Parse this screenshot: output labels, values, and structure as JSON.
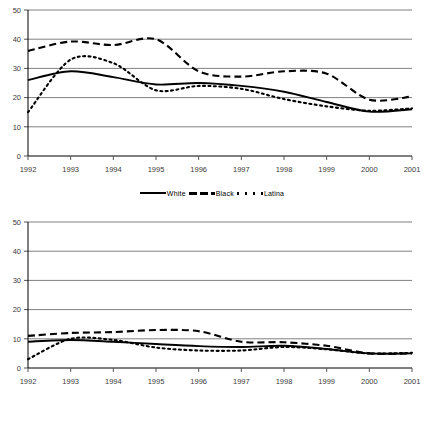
{
  "legend": {
    "items": [
      {
        "label": "White",
        "style": "solid"
      },
      {
        "label": "Black",
        "style": "dashed"
      },
      {
        "label": "Latina",
        "style": "dotted"
      }
    ]
  },
  "chart_data": [
    {
      "id": "top",
      "type": "line",
      "title": "",
      "xlabel": "",
      "ylabel": "",
      "grid": true,
      "legend_position": "bottom",
      "x": [
        "1992",
        "1993",
        "1994",
        "1995",
        "1996",
        "1997",
        "1998",
        "1999",
        "2000",
        "2001"
      ],
      "xtick_labels": [
        "1992",
        "1993",
        "1994",
        "1995",
        "1996",
        "1997",
        "1998",
        "1999",
        "2000",
        "2001"
      ],
      "ytick_labels": [
        "0",
        "10",
        "20",
        "30",
        "40",
        "50"
      ],
      "yticks": [
        0,
        10,
        20,
        30,
        40,
        50
      ],
      "ylim": [
        0,
        50
      ],
      "series": [
        {
          "name": "White",
          "values": [
            26,
            29,
            27,
            24.5,
            25,
            24,
            22,
            18.5,
            15.2,
            16
          ]
        },
        {
          "name": "Black",
          "values": [
            36,
            39.2,
            38,
            40,
            29,
            27.2,
            29,
            28.2,
            19.3,
            20.4
          ]
        },
        {
          "name": "Latina",
          "values": [
            15,
            33,
            31.8,
            22.5,
            24,
            23,
            19.5,
            17,
            15.5,
            16.3
          ]
        }
      ]
    },
    {
      "id": "bottom",
      "type": "line",
      "title": "",
      "xlabel": "",
      "ylabel": "",
      "grid": true,
      "legend_position": "bottom",
      "x": [
        "1992",
        "1993",
        "1994",
        "1995",
        "1996",
        "1997",
        "1998",
        "1999",
        "2000",
        "2001"
      ],
      "xtick_labels": [
        "1992",
        "1993",
        "1994",
        "1995",
        "1996",
        "1997",
        "1998",
        "1999",
        "2000",
        "2001"
      ],
      "ytick_labels": [
        "0",
        "10",
        "20",
        "30",
        "40",
        "50"
      ],
      "yticks": [
        0,
        10,
        20,
        30,
        40,
        50
      ],
      "ylim": [
        0,
        50
      ],
      "series": [
        {
          "name": "White",
          "values": [
            9,
            9.6,
            9,
            8.2,
            7.5,
            7.2,
            7.6,
            6.5,
            5,
            5
          ]
        },
        {
          "name": "Black",
          "values": [
            11,
            12,
            12.3,
            13,
            12.6,
            9,
            8.8,
            7.6,
            5,
            5
          ]
        },
        {
          "name": "Latina",
          "values": [
            3,
            10,
            9.6,
            7,
            6,
            6,
            7.2,
            6.4,
            5,
            5.2
          ]
        }
      ]
    }
  ]
}
